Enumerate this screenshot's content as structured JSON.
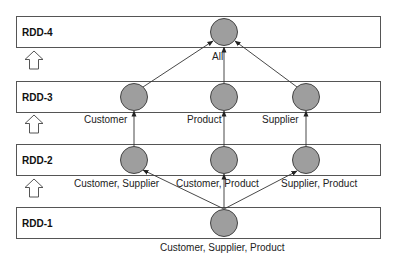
{
  "diagram": {
    "layers": [
      {
        "id": "rdd4",
        "label": "RDD-4"
      },
      {
        "id": "rdd3",
        "label": "RDD-3"
      },
      {
        "id": "rdd2",
        "label": "RDD-2"
      },
      {
        "id": "rdd1",
        "label": "RDD-1"
      }
    ],
    "nodes": [
      {
        "id": "all",
        "layer": "rdd4",
        "label": "All"
      },
      {
        "id": "customer",
        "layer": "rdd3",
        "label": "Customer"
      },
      {
        "id": "product",
        "layer": "rdd3",
        "label": "Product"
      },
      {
        "id": "supplier",
        "layer": "rdd3",
        "label": "Supplier"
      },
      {
        "id": "cust_supp",
        "layer": "rdd2",
        "label": "Customer, Supplier"
      },
      {
        "id": "cust_prod",
        "layer": "rdd2",
        "label": "Customer, Product"
      },
      {
        "id": "supp_prod",
        "layer": "rdd2",
        "label": "Supplier, Product"
      },
      {
        "id": "cust_supp_prod",
        "layer": "rdd1",
        "label": "Customer, Supplier, Product"
      }
    ],
    "edges": [
      {
        "from": "cust_supp_prod",
        "to": "cust_supp"
      },
      {
        "from": "cust_supp_prod",
        "to": "cust_prod"
      },
      {
        "from": "cust_supp_prod",
        "to": "supp_prod"
      },
      {
        "from": "cust_supp",
        "to": "customer"
      },
      {
        "from": "cust_prod",
        "to": "product"
      },
      {
        "from": "supp_prod",
        "to": "supplier"
      },
      {
        "from": "customer",
        "to": "all"
      },
      {
        "from": "product",
        "to": "all"
      },
      {
        "from": "supplier",
        "to": "all"
      }
    ],
    "colors": {
      "node_fill": "#9e9e9e",
      "node_stroke": "#444444",
      "box_stroke": "#555555"
    }
  }
}
